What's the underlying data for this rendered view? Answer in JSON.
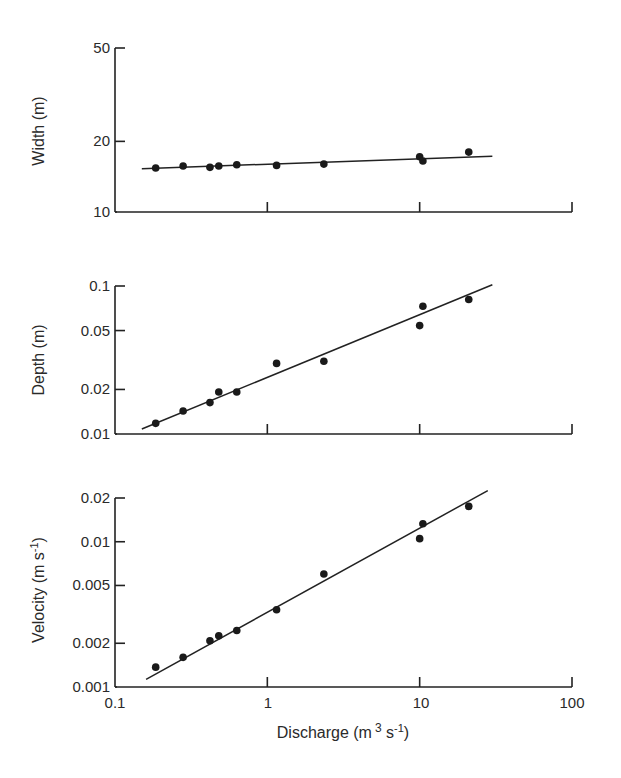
{
  "figure": {
    "xlabel": "Discharge (m³ s⁻¹)",
    "xlabel_parts": {
      "base": "Discharge (m",
      "sup1": "3",
      "mid": " s",
      "sup2": "-1",
      "end": ")"
    },
    "x_ticks": [
      "0.1",
      "1",
      "10",
      "100"
    ],
    "panels": [
      {
        "id": "width",
        "ylabel": "Width (m)",
        "y_ticks": [
          "10",
          "20",
          "50"
        ]
      },
      {
        "id": "depth",
        "ylabel": "Depth (m)",
        "y_ticks": [
          "0.01",
          "0.02",
          "0.05",
          "0.1"
        ]
      },
      {
        "id": "velocity",
        "ylabel_base": "Velocity (m s",
        "ylabel_sup": "-1",
        "ylabel_end": ")",
        "ylabel": "Velocity (m s⁻¹)",
        "y_ticks": [
          "0.001",
          "0.002",
          "0.005",
          "0.01",
          "0.02"
        ]
      }
    ]
  },
  "chart_data": [
    {
      "type": "scatter",
      "title": "",
      "xlabel": "Discharge (m³ s⁻¹)",
      "ylabel": "Width (m)",
      "xscale": "log",
      "yscale": "log",
      "xlim": [
        0.1,
        100
      ],
      "ylim": [
        10,
        50
      ],
      "x_ticks": [
        0.1,
        1,
        10,
        100
      ],
      "y_ticks": [
        10,
        20,
        50
      ],
      "grid": false,
      "x": [
        0.185,
        0.28,
        0.42,
        0.48,
        0.63,
        1.15,
        2.35,
        10.0,
        10.5,
        21.0
      ],
      "y": [
        15.4,
        15.7,
        15.5,
        15.7,
        15.9,
        15.8,
        16.0,
        17.2,
        16.5,
        18.0
      ],
      "fit_line": {
        "x": [
          0.15,
          30
        ],
        "y": [
          15.3,
          17.3
        ]
      }
    },
    {
      "type": "scatter",
      "title": "",
      "xlabel": "Discharge (m³ s⁻¹)",
      "ylabel": "Depth (m)",
      "xscale": "log",
      "yscale": "log",
      "xlim": [
        0.1,
        100
      ],
      "ylim": [
        0.01,
        0.1
      ],
      "x_ticks": [
        0.1,
        1,
        10,
        100
      ],
      "y_ticks": [
        0.01,
        0.02,
        0.05,
        0.1
      ],
      "grid": false,
      "x": [
        0.185,
        0.28,
        0.42,
        0.48,
        0.63,
        1.15,
        2.35,
        10.0,
        10.5,
        21.0
      ],
      "y": [
        0.0118,
        0.0143,
        0.0163,
        0.0192,
        0.0192,
        0.03,
        0.031,
        0.054,
        0.073,
        0.081
      ],
      "fit_line": {
        "x": [
          0.15,
          30
        ],
        "y": [
          0.0108,
          0.102
        ]
      }
    },
    {
      "type": "scatter",
      "title": "",
      "xlabel": "Discharge (m³ s⁻¹)",
      "ylabel": "Velocity (m s⁻¹)",
      "xscale": "log",
      "yscale": "log",
      "xlim": [
        0.1,
        100
      ],
      "ylim": [
        0.001,
        0.02
      ],
      "x_ticks": [
        0.1,
        1,
        10,
        100
      ],
      "y_ticks": [
        0.001,
        0.002,
        0.005,
        0.01,
        0.02
      ],
      "grid": false,
      "x": [
        0.185,
        0.28,
        0.42,
        0.48,
        0.63,
        1.15,
        2.35,
        10.0,
        10.5,
        21.0
      ],
      "y": [
        0.00137,
        0.0016,
        0.00208,
        0.00225,
        0.00245,
        0.0034,
        0.006,
        0.0105,
        0.0133,
        0.0175
      ],
      "fit_line": {
        "x": [
          0.16,
          28
        ],
        "y": [
          0.00113,
          0.0225
        ]
      }
    }
  ]
}
